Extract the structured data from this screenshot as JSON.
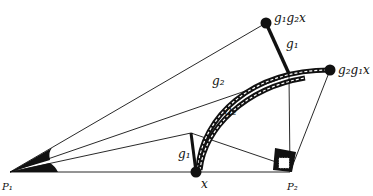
{
  "diagram": {
    "points": {
      "p1": "P₁",
      "p2": "P₂",
      "x": "x",
      "g1g2x": "g₁g₂x",
      "g2g1x": "g₂g₁x"
    },
    "edges": {
      "g1_top": "g₁",
      "g1_bottom": "g₁",
      "g2_outer": "g₂",
      "g2_inner": "g₂"
    },
    "colors": {
      "ink": "#111111",
      "background": "#ffffff"
    }
  }
}
